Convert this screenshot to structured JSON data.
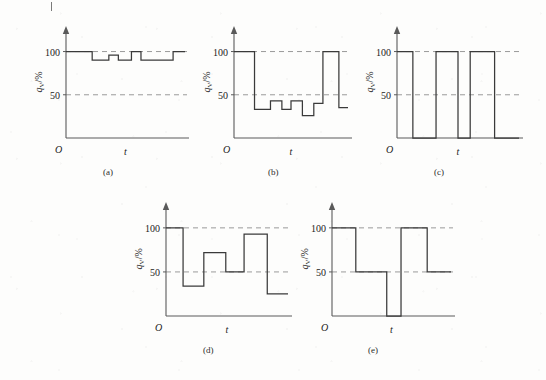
{
  "figure": {
    "title": "",
    "page_mark": "|",
    "panels": [
      {
        "key": "a",
        "caption": "(a)",
        "origin_label": "O",
        "xlabel": "t",
        "ylabel": "q_V/%",
        "ylabel_main": "q",
        "ylabel_sub": "V",
        "ylabel_unit": "/%",
        "yticks": [
          "100",
          "50"
        ],
        "ytick_values": [
          100,
          50
        ]
      },
      {
        "key": "b",
        "caption": "(b)",
        "origin_label": "O",
        "xlabel": "t",
        "ylabel": "q_V/%",
        "ylabel_main": "q",
        "ylabel_sub": "V",
        "ylabel_unit": "/%",
        "yticks": [
          "100",
          "50"
        ],
        "ytick_values": [
          100,
          50
        ]
      },
      {
        "key": "c",
        "caption": "(c)",
        "origin_label": "O",
        "xlabel": "t",
        "ylabel": "q_V/%",
        "ylabel_main": "q",
        "ylabel_sub": "V",
        "ylabel_unit": "/%",
        "yticks": [
          "100",
          "50"
        ],
        "ytick_values": [
          100,
          50
        ]
      },
      {
        "key": "d",
        "caption": "(d)",
        "origin_label": "O",
        "xlabel": "t",
        "ylabel": "q_V/%",
        "ylabel_main": "q",
        "ylabel_sub": "V",
        "ylabel_unit": "/%",
        "yticks": [
          "100",
          "50"
        ],
        "ytick_values": [
          100,
          50
        ]
      },
      {
        "key": "e",
        "caption": "(e)",
        "origin_label": "O",
        "xlabel": "t",
        "ylabel": "q_V/%",
        "ylabel_main": "q",
        "ylabel_sub": "V",
        "ylabel_unit": "/%",
        "yticks": [
          "100",
          "50"
        ],
        "ytick_values": [
          100,
          50
        ]
      }
    ]
  },
  "colors": {
    "ink": "#3a3a3a",
    "axis": "#5a5a5a",
    "dashed": "#9a9a9a",
    "paper": "#fdfdfc"
  },
  "chart_data": [
    {
      "id": "a",
      "type": "line",
      "step": true,
      "title": "(a)",
      "xlabel": "t",
      "ylabel": "q_V/%",
      "ylim": [
        0,
        118
      ],
      "xlim": [
        0,
        1
      ],
      "grid": "dashed-horizontal",
      "gridlines": [
        100,
        50
      ],
      "ytick_labels": [
        "100",
        "50"
      ],
      "ytick_values": [
        100,
        50
      ],
      "legend": "none",
      "x": [
        0.0,
        0.22,
        0.36,
        0.44,
        0.55,
        0.63,
        0.8,
        1.0
      ],
      "values": [
        100,
        100,
        90,
        90,
        96,
        90,
        100,
        90
      ],
      "series": [
        {
          "name": "q_V",
          "segments": [
            {
              "x0": 0.0,
              "x1": 0.22,
              "y": 100
            },
            {
              "x0": 0.22,
              "x1": 0.36,
              "y": 90
            },
            {
              "x0": 0.36,
              "x1": 0.44,
              "y": 96
            },
            {
              "x0": 0.44,
              "x1": 0.55,
              "y": 90
            },
            {
              "x0": 0.55,
              "x1": 0.63,
              "y": 100
            },
            {
              "x0": 0.63,
              "x1": 0.9,
              "y": 90
            },
            {
              "x0": 0.9,
              "x1": 1.0,
              "y": 100
            }
          ]
        }
      ]
    },
    {
      "id": "b",
      "type": "line",
      "step": true,
      "title": "(b)",
      "xlabel": "t",
      "ylabel": "q_V/%",
      "ylim": [
        0,
        118
      ],
      "xlim": [
        0,
        1
      ],
      "grid": "dashed-horizontal",
      "gridlines": [
        100,
        50
      ],
      "ytick_labels": [
        "100",
        "50"
      ],
      "ytick_values": [
        100,
        50
      ],
      "legend": "none",
      "series": [
        {
          "name": "q_V",
          "segments": [
            {
              "x0": 0.0,
              "x1": 0.18,
              "y": 100
            },
            {
              "x0": 0.18,
              "x1": 0.32,
              "y": 33
            },
            {
              "x0": 0.32,
              "x1": 0.42,
              "y": 43
            },
            {
              "x0": 0.42,
              "x1": 0.5,
              "y": 33
            },
            {
              "x0": 0.5,
              "x1": 0.6,
              "y": 43
            },
            {
              "x0": 0.6,
              "x1": 0.7,
              "y": 26
            },
            {
              "x0": 0.7,
              "x1": 0.78,
              "y": 40
            },
            {
              "x0": 0.78,
              "x1": 0.92,
              "y": 100
            },
            {
              "x0": 0.92,
              "x1": 1.0,
              "y": 35
            }
          ]
        }
      ]
    },
    {
      "id": "c",
      "type": "line",
      "step": true,
      "title": "(c)",
      "xlabel": "t",
      "ylabel": "q_V/%",
      "ylim": [
        0,
        118
      ],
      "xlim": [
        0,
        1
      ],
      "grid": "dashed-horizontal",
      "gridlines": [
        100,
        50
      ],
      "ytick_labels": [
        "100",
        "50"
      ],
      "ytick_values": [
        100,
        50
      ],
      "legend": "none",
      "series": [
        {
          "name": "q_V",
          "segments": [
            {
              "x0": 0.0,
              "x1": 0.13,
              "y": 100
            },
            {
              "x0": 0.13,
              "x1": 0.32,
              "y": 0
            },
            {
              "x0": 0.32,
              "x1": 0.5,
              "y": 100
            },
            {
              "x0": 0.5,
              "x1": 0.6,
              "y": 0
            },
            {
              "x0": 0.6,
              "x1": 0.8,
              "y": 100
            },
            {
              "x0": 0.8,
              "x1": 1.0,
              "y": 0
            }
          ]
        }
      ]
    },
    {
      "id": "d",
      "type": "line",
      "step": true,
      "title": "(d)",
      "xlabel": "t",
      "ylabel": "q_V/%",
      "ylim": [
        0,
        118
      ],
      "xlim": [
        0,
        1
      ],
      "grid": "dashed-horizontal",
      "gridlines": [
        100,
        50
      ],
      "ytick_labels": [
        "100",
        "50"
      ],
      "ytick_values": [
        100,
        50
      ],
      "legend": "none",
      "series": [
        {
          "name": "q_V",
          "segments": [
            {
              "x0": 0.0,
              "x1": 0.14,
              "y": 100
            },
            {
              "x0": 0.14,
              "x1": 0.31,
              "y": 34
            },
            {
              "x0": 0.31,
              "x1": 0.49,
              "y": 72
            },
            {
              "x0": 0.49,
              "x1": 0.64,
              "y": 50
            },
            {
              "x0": 0.64,
              "x1": 0.83,
              "y": 93
            },
            {
              "x0": 0.83,
              "x1": 1.0,
              "y": 25
            }
          ]
        }
      ]
    },
    {
      "id": "e",
      "type": "line",
      "step": true,
      "title": "(e)",
      "xlabel": "t",
      "ylabel": "q_V/%",
      "ylim": [
        0,
        118
      ],
      "xlim": [
        0,
        1
      ],
      "grid": "dashed-horizontal",
      "gridlines": [
        100,
        50
      ],
      "ytick_labels": [
        "100",
        "50"
      ],
      "ytick_values": [
        100,
        50
      ],
      "legend": "none",
      "series": [
        {
          "name": "q_V",
          "segments": [
            {
              "x0": 0.0,
              "x1": 0.2,
              "y": 100
            },
            {
              "x0": 0.2,
              "x1": 0.46,
              "y": 50
            },
            {
              "x0": 0.46,
              "x1": 0.58,
              "y": 0
            },
            {
              "x0": 0.58,
              "x1": 0.8,
              "y": 100
            },
            {
              "x0": 0.8,
              "x1": 1.0,
              "y": 50
            }
          ]
        }
      ]
    }
  ],
  "layout": {
    "panel_boxes": [
      {
        "id": "a",
        "left": 24,
        "top": 22,
        "w": 165,
        "h": 150
      },
      {
        "id": "b",
        "left": 192,
        "top": 22,
        "w": 160,
        "h": 150
      },
      {
        "id": "c",
        "left": 355,
        "top": 22,
        "w": 168,
        "h": 150
      },
      {
        "id": "d",
        "left": 124,
        "top": 198,
        "w": 168,
        "h": 152
      },
      {
        "id": "e",
        "left": 290,
        "top": 198,
        "w": 165,
        "h": 152
      }
    ]
  }
}
